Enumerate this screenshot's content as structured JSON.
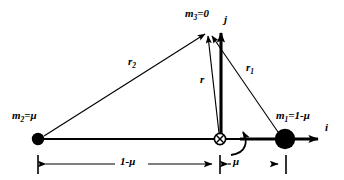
{
  "figure": {
    "type": "vector-diagram",
    "background_color": "#ffffff",
    "line_color": "#000000"
  },
  "bodies": [
    {
      "id": "m2",
      "label_html": "m<sub>2</sub>=μ",
      "label_text": "m2=μ",
      "mass_expression": "μ",
      "x": 38,
      "y": 139,
      "radius": 6
    },
    {
      "id": "m1",
      "label_html": "m<sub>1</sub>=1-μ",
      "label_text": "m1=1-μ",
      "mass_expression": "1-μ",
      "x": 285,
      "y": 139,
      "radius": 10
    },
    {
      "id": "m3",
      "label_html": "m<sub>3</sub>=0",
      "label_text": "m3=0",
      "mass_expression": "0",
      "x": 206,
      "y": 31,
      "radius": 0
    }
  ],
  "origin": {
    "id": "barycenter",
    "symbol": "crossed-circle",
    "x": 220,
    "y": 139,
    "radius": 6
  },
  "vectors": [
    {
      "id": "r2",
      "label_html": "r<sub>2</sub>",
      "label_text": "r2",
      "from": "m2",
      "to": "m3",
      "x1": 44,
      "y1": 136,
      "x2": 203,
      "y2": 33,
      "weight": 1.1
    },
    {
      "id": "r1",
      "label_html": "r<sub>1</sub>",
      "label_text": "r1",
      "from": "m1",
      "to": "m3",
      "x1": 277,
      "y1": 132,
      "x2": 210,
      "y2": 34,
      "weight": 1.1
    },
    {
      "id": "r",
      "label_html": "r",
      "label_text": "r",
      "from": "barycenter",
      "to": "m3",
      "x1": 219,
      "y1": 133,
      "x2": 207,
      "y2": 35,
      "weight": 1.1
    },
    {
      "id": "j",
      "label_html": "j",
      "label_text": "j",
      "from": "barycenter",
      "to": "jhat",
      "x1": 221,
      "y1": 137,
      "x2": 221,
      "y2": 30,
      "weight": 3.0
    },
    {
      "id": "i",
      "label_html": "i",
      "label_text": "i",
      "from": "barycenter",
      "to": "ihat",
      "x1": 220,
      "y1": 139,
      "x2": 322,
      "y2": 139,
      "weight": 3.0
    }
  ],
  "vector_labels": [
    {
      "id": "r2-label",
      "html": "r<sub>2</sub>",
      "x": 128,
      "y": 56
    },
    {
      "id": "r1-label",
      "html": "r<sub>1</sub>",
      "x": 246,
      "y": 62
    },
    {
      "id": "r-label",
      "html": "r",
      "x": 200,
      "y": 74
    },
    {
      "id": "j-label",
      "html": "j",
      "x": 224,
      "y": 14
    },
    {
      "id": "i-label",
      "html": "i",
      "x": 325,
      "y": 122
    }
  ],
  "mass_labels": [
    {
      "id": "m2-label",
      "html": "m<sub>2</sub>=μ",
      "x": 12,
      "y": 110
    },
    {
      "id": "m1-label",
      "html": "m<sub>1</sub>=1-μ",
      "x": 276,
      "y": 110
    },
    {
      "id": "m3-label",
      "html": "m<sub>3</sub>=0",
      "x": 185,
      "y": 8
    }
  ],
  "axis_line": {
    "x1": 38,
    "y1": 139,
    "x2": 285,
    "y2": 139
  },
  "rotation_arrow": {
    "id": "rotation-indicator",
    "description": "curved arrow indicating rotating frame",
    "path": "M 232,154 C 247,152 248,140 243,130"
  },
  "dimensions": [
    {
      "id": "dim-1-minus-mu",
      "label_html": "1-μ",
      "label_text": "1-μ",
      "label_x": 120,
      "label_y": 156,
      "y": 164,
      "x_start": 38,
      "x_end": 220,
      "tick_top": 155,
      "tick_bottom": 174
    },
    {
      "id": "dim-mu",
      "label_html": "μ",
      "label_text": "μ",
      "label_x": 233,
      "label_y": 156,
      "y": 164,
      "x_start": 220,
      "x_end": 286,
      "tick_top": 155,
      "tick_bottom": 174
    }
  ]
}
